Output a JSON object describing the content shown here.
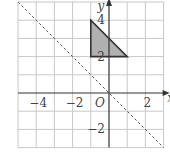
{
  "figure": {
    "type": "coordinate-grid",
    "x_range": [
      -5,
      3
    ],
    "y_range": [
      -3,
      5
    ],
    "axis_labels": {
      "x": "x",
      "y": "y",
      "origin": "O"
    },
    "x_tick_labels": [
      {
        "value": -4,
        "text": "−4"
      },
      {
        "value": -2,
        "text": "−2"
      },
      {
        "value": 2,
        "text": "2"
      }
    ],
    "y_tick_labels": [
      {
        "value": 4,
        "text": "4"
      },
      {
        "value": 2,
        "text": "2"
      },
      {
        "value": -2,
        "text": "−2"
      }
    ],
    "shape": {
      "name": "triangle",
      "vertices": [
        [
          -1,
          4
        ],
        [
          -1,
          2
        ],
        [
          1,
          2
        ]
      ],
      "fill": "#b0b0b0",
      "stroke": "#333333"
    },
    "mirror_line": {
      "equation": "y = -x",
      "from": [
        -5,
        5
      ],
      "to": [
        3,
        -3
      ],
      "style": "dashed"
    },
    "colors": {
      "grid": "#c8c8c8",
      "axis": "#333333"
    }
  }
}
